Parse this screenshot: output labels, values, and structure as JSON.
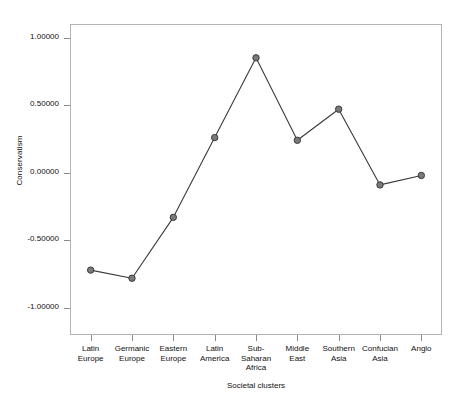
{
  "chart_data": {
    "type": "line",
    "title": "",
    "xlabel": "Societal clusters",
    "ylabel": "Conservatism",
    "categories": [
      "Latin Europe",
      "Germanic Europe",
      "Eastern Europe",
      "Latin America",
      "Sub-Saharan Africa",
      "Middle East",
      "Southern Asia",
      "Confucian Asia",
      "Anglo"
    ],
    "category_lines": [
      [
        "Latin",
        "Europe"
      ],
      [
        "Germanic",
        "Europe"
      ],
      [
        "Eastern",
        "Europe"
      ],
      [
        "Latin",
        "America"
      ],
      [
        "Sub-",
        "Saharan",
        "Africa"
      ],
      [
        "Middle",
        "East"
      ],
      [
        "Southern",
        "Asia"
      ],
      [
        "Confucian",
        "Asia"
      ],
      [
        "Anglo"
      ]
    ],
    "values": [
      -0.72,
      -0.78,
      -0.33,
      0.26,
      0.85,
      0.24,
      0.47,
      -0.09,
      -0.02
    ],
    "ylim": [
      -1.2,
      1.1
    ],
    "yticks": [
      1.0,
      0.5,
      0.0,
      -0.5,
      -1.0
    ],
    "ytick_labels": [
      "1.00000",
      "0.50000",
      "0.00000",
      "-0.50000",
      "-1.00000"
    ],
    "grid": false,
    "legend": null,
    "line_color": "#3a3a3a",
    "marker_fill": "#7a7a7a",
    "marker_edge": "#3a3a3a",
    "frame_color": "#b4b4b4",
    "background": "#ffffff"
  }
}
